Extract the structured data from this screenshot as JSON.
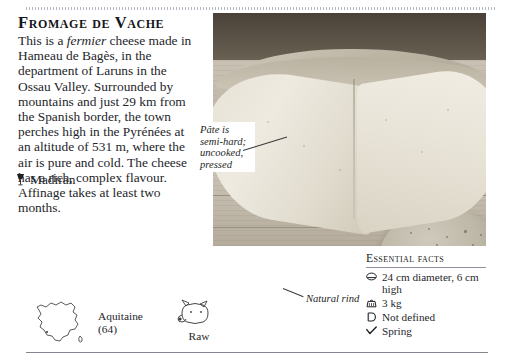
{
  "page": {
    "title": "Fromage de Vache",
    "body_paragraph": "This is a fermier cheese made in Hameau de Bagès, in the department of Laruns in the Ossau Valley. Surrounded by mountains and just 29 km from the Spanish border, the town perches high in the Pyrénées at an altitude of 531 m, where the air is pure and cold. The cheese has a rich, complex flavour. Affinage takes at least two months.",
    "body_italic_word": "fermier",
    "body_before_italic": "This is a ",
    "body_after_italic": " cheese made in Hameau de Bagès, in the department of Laruns in the Ossau Valley. Surrounded by mountains and just 29 km from the Spanish border, the town perches high in the Pyrénées at an altitude of 531 m, where the air is pure and cold. The cheese has a rich, complex flavour. Affinage takes at least two months.",
    "wine_pairing": "Madiran"
  },
  "origin": {
    "region_line1": "Aquitaine",
    "region_line2": "(64)",
    "milk_label": "Raw"
  },
  "callouts": {
    "pate": "Pâte is semi-hard; uncooked, pressed",
    "rind": "Natural rind"
  },
  "essential_facts": {
    "heading": "Essential facts",
    "items": [
      {
        "icon": "size-icon",
        "text": "24 cm diameter, 6 cm high"
      },
      {
        "icon": "weight-icon",
        "text": "3 kg"
      },
      {
        "icon": "fat-icon",
        "text": "Not defined"
      },
      {
        "icon": "season-icon",
        "text": "Spring"
      }
    ]
  },
  "colors": {
    "text": "#24252a",
    "rule": "#6d717a",
    "heading": "#15161a"
  }
}
